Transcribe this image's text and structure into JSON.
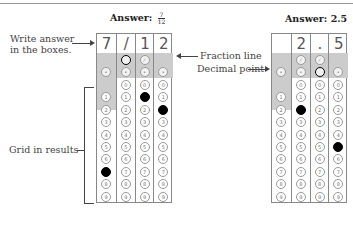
{
  "header": {
    "cut_text": "... ... ..."
  },
  "left_example": {
    "title_prefix": "Answer:",
    "fraction": {
      "numerator": "7",
      "denominator": "12"
    },
    "boxes": [
      "7",
      "/",
      "1",
      "2"
    ],
    "filled": {
      "slash_col": 1,
      "digits": [
        7,
        null,
        1,
        2
      ]
    }
  },
  "right_example": {
    "title": "Answer: 2.5",
    "boxes": [
      "",
      "2",
      ".",
      "5"
    ],
    "filled": {
      "decimal_col": 2,
      "digits": [
        null,
        2,
        null,
        5
      ]
    }
  },
  "labels": {
    "write_answer": "Write answer\nin the boxes.",
    "write_answer_line1": "Write answer",
    "write_answer_line2": "in the boxes.",
    "fraction_line": "Fraction line",
    "decimal_point": "Decimal point",
    "grid_in_results": "Grid in results"
  },
  "bubble_symbols": {
    "slash": "⊘",
    "decimal": "·"
  },
  "digits": [
    "0",
    "1",
    "2",
    "3",
    "4",
    "5",
    "6",
    "7",
    "8",
    "9"
  ],
  "colors": {
    "shade": "#cccccc",
    "border": "#888888",
    "fill": "#000000",
    "text": "#444444"
  }
}
